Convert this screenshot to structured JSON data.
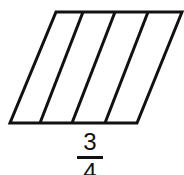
{
  "diagram": {
    "shape": "parallelogram",
    "parts": 4,
    "stroke_color": "#111111"
  },
  "fraction": {
    "numerator": "3",
    "denominator": "4"
  }
}
